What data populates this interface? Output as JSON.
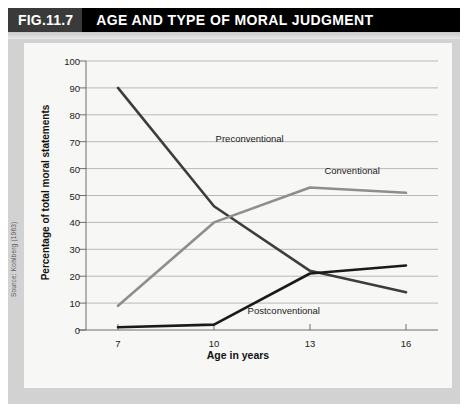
{
  "header": {
    "fig_number": "FIG.11.7",
    "title": "AGE AND TYPE OF MORAL JUDGMENT"
  },
  "source": "Source: Kohlberg (1963)",
  "colors": {
    "header_background": "#000000",
    "fig_number_background": "#3a3a3a",
    "outer_frame": "#d2d2d2",
    "panel_background": "#f7f7f5",
    "gridline": "#b9b9b9",
    "axis": "#6e6e6e",
    "preconventional": "#3d3d3d",
    "conventional": "#8e8e8e",
    "postconventional": "#1a1a1a"
  },
  "chart_data": {
    "type": "line",
    "title": "AGE AND TYPE OF MORAL JUDGMENT",
    "xlabel": "Age in years",
    "ylabel": "Percentage of total moral statements",
    "x": [
      7,
      10,
      13,
      16
    ],
    "xlim": [
      6,
      17
    ],
    "ylim": [
      0,
      100
    ],
    "ytick_values": [
      0,
      10,
      20,
      30,
      40,
      50,
      60,
      70,
      80,
      90,
      100
    ],
    "ytick_labels": [
      "0",
      "10",
      "20",
      "30",
      "40",
      "50",
      "60",
      "70",
      "80",
      "90",
      "100"
    ],
    "xtick_values": [
      7,
      10,
      13,
      16
    ],
    "xtick_labels": [
      "7",
      "10",
      "13",
      "16"
    ],
    "grid": "horizontal",
    "legend": "inline-annotations",
    "series": [
      {
        "name": "Preconventional",
        "color": "#3d3d3d",
        "values": [
          90,
          46,
          22,
          14
        ],
        "label_x": 10.05,
        "label_y": 71
      },
      {
        "name": "Conventional",
        "color": "#8e8e8e",
        "values": [
          9,
          40,
          53,
          51
        ],
        "label_x": 13.45,
        "label_y": 59
      },
      {
        "name": "Postconventional",
        "color": "#1a1a1a",
        "values": [
          1,
          2,
          21,
          24
        ],
        "label_x": 11.05,
        "label_y": 7
      }
    ]
  }
}
